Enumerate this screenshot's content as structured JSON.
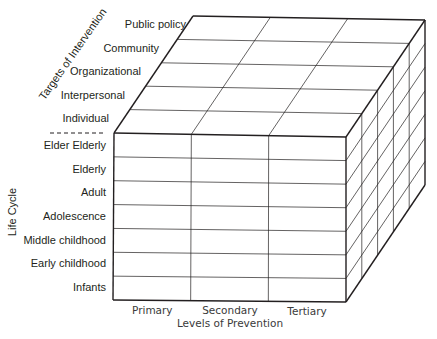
{
  "diagram": {
    "type": "3d-cube-matrix",
    "axes": {
      "targets_of_intervention": {
        "title": "Targets of Intervention",
        "levels": [
          "Public policy",
          "Community",
          "Organizational",
          "Interpersonal",
          "Individual"
        ]
      },
      "life_cycle": {
        "title": "Life Cycle",
        "levels": [
          "Elder Elderly",
          "Elderly",
          "Adult",
          "Adolescence",
          "Middle childhood",
          "Early childhood",
          "Infants"
        ]
      },
      "levels_of_prevention": {
        "title": "Levels of Prevention",
        "levels": [
          "Primary",
          "Secondary",
          "Tertiary"
        ]
      }
    },
    "colors": {
      "line": "#231f20",
      "background": "#ffffff"
    }
  }
}
